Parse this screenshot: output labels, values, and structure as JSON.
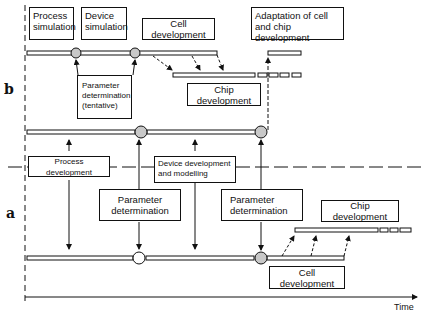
{
  "diagram": {
    "sections": {
      "b": "b",
      "a": "a"
    },
    "axis": {
      "x_label": "Time"
    },
    "section_b": {
      "boxes": {
        "process_simulation": [
          "Process",
          "simulation"
        ],
        "device_simulation": [
          "Device",
          "simulation"
        ],
        "cell_development": "Cell development",
        "adaptation": [
          "Adaptation of cell",
          "and chip development"
        ],
        "parameter_tentative": [
          "Parameter",
          "determination",
          "(tentative)"
        ],
        "chip_development": "Chip development"
      }
    },
    "section_a": {
      "boxes": {
        "process_development": "Process development",
        "device_development": [
          "Device development",
          "and modelling"
        ],
        "parameter_1": [
          "Parameter",
          "determination"
        ],
        "parameter_2": [
          "Parameter",
          "determination"
        ],
        "chip_development": "Chip development",
        "cell_development": "Cell development"
      }
    },
    "colors": {
      "line": "#111111",
      "milestone_fill": "#c8c8c8",
      "milestone_open": "#ffffff",
      "background": "#ffffff"
    }
  }
}
